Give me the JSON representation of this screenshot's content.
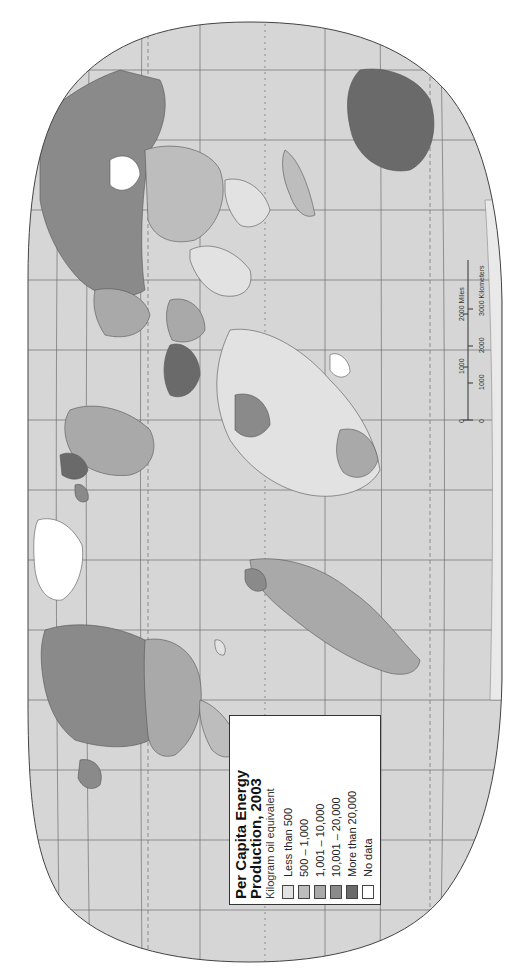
{
  "map": {
    "title_line1": "Per Capita Energy",
    "title_line2": "Production, 2003",
    "subtitle": "Kilogram oil equivalent",
    "orientation": "rotated 90° counter-clockwise",
    "colors": {
      "ocean": "#d6d6d6",
      "graticule": "#6e6e6e",
      "outline": "#444444",
      "no_data": "#ffffff"
    }
  },
  "legend": {
    "items": [
      {
        "label": "Less than 500",
        "color": "#e2e2e2"
      },
      {
        "label": "500 – 1,000",
        "color": "#bdbdbd"
      },
      {
        "label": "1,001 – 10,000",
        "color": "#a9a9a9"
      },
      {
        "label": "10,001 – 20,000",
        "color": "#8a8a8a"
      },
      {
        "label": "More than 20,000",
        "color": "#6a6a6a"
      },
      {
        "label": "No data",
        "color": "#ffffff"
      }
    ]
  },
  "scale_bar": {
    "miles_ticks": [
      "0",
      "1000",
      "2000 Miles"
    ],
    "km_ticks": [
      "0",
      "1000",
      "2000",
      "3000 Kilometers"
    ]
  }
}
